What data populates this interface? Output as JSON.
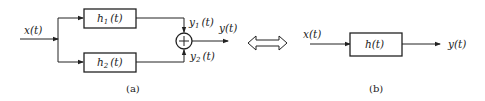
{
  "diagram": {
    "left": {
      "caption": "(a)",
      "input_label": "x(t)",
      "box_top_label": "h",
      "box_top_sub": "1",
      "box_top_arg": "(t)",
      "box_bottom_label": "h",
      "box_bottom_sub": "2",
      "box_bottom_arg": "(t)",
      "y1_label": "y",
      "y1_sub": "1",
      "y1_arg": "(t)",
      "y2_label": "y",
      "y2_sub": "2",
      "y2_arg": "(t)",
      "output_label": "y(t)",
      "summer_symbol": "+"
    },
    "equivalence": "double-arrow",
    "right": {
      "caption": "(b)",
      "input_label": "x(t)",
      "box_label": "h(t)",
      "output_label": "y(t)"
    }
  }
}
